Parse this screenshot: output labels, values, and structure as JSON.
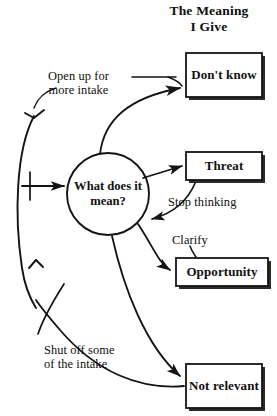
{
  "title": "The Meaning\nI Give",
  "center_node": {
    "name": "center-question",
    "text": "What does\nit mean?"
  },
  "outcome_boxes": [
    {
      "id": "dont-know",
      "text": "Don't\nknow",
      "x": 186,
      "y": 53,
      "w": 76,
      "h": 44
    },
    {
      "id": "threat",
      "text": "Threat",
      "x": 186,
      "y": 152,
      "w": 76,
      "h": 28
    },
    {
      "id": "opportunity",
      "text": "Opportunity",
      "x": 176,
      "y": 258,
      "w": 92,
      "h": 28
    },
    {
      "id": "not-relevant",
      "text": "Not\nrelevant",
      "x": 186,
      "y": 364,
      "w": 76,
      "h": 44
    }
  ],
  "annotations": {
    "open_up": "Open up for\nmore intake",
    "stop_thinking": "Stop thinking",
    "clarify": "Clarify",
    "shut_off": "Shut off some\nof the intake"
  },
  "colors": {
    "ink": "#0d0d0d",
    "stroke": "#1a1a1a",
    "background": "#ffffff",
    "shadow": "#2b2b2b"
  },
  "diagram": {
    "type": "flow-diagram",
    "edges": [
      {
        "from": "center-question",
        "to": "dont-know",
        "label": "Open up for more intake",
        "style": "curved-arrow"
      },
      {
        "from": "center-question",
        "to": "threat",
        "label": "",
        "style": "straight-arrow"
      },
      {
        "from": "threat",
        "to": "center-question",
        "label": "Stop thinking",
        "style": "curved-arrow-feedback"
      },
      {
        "from": "center-question",
        "to": "opportunity",
        "label": "Clarify",
        "style": "curved-arrow"
      },
      {
        "from": "center-question",
        "to": "not-relevant",
        "label": "",
        "style": "curved-arrow"
      },
      {
        "from": "not-relevant",
        "to": "intake-arc",
        "label": "Shut off some of the intake",
        "style": "curved-arrow"
      },
      {
        "from": "intake-arc",
        "to": "center-question",
        "label": "",
        "style": "straight-arrow"
      }
    ]
  }
}
